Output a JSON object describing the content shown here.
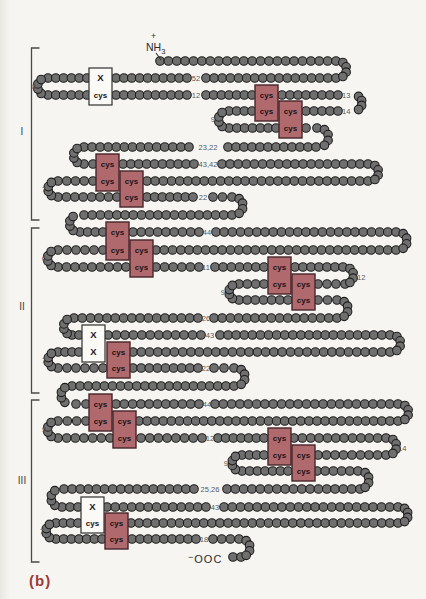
{
  "figure": {
    "panel_label": "(b)",
    "description_type": "protein-chain-loop-diagram",
    "amino_terminus": {
      "charge": "+",
      "text": "NH",
      "subscript": "3"
    },
    "carboxy_terminus": {
      "charge": "−",
      "text": "OOC"
    },
    "domains": [
      {
        "numeral": "I",
        "label_x": 22,
        "label_y": 135,
        "bracket": {
          "x": 31.5,
          "y1": 48,
          "y2": 220,
          "tick": 8
        }
      },
      {
        "numeral": "II",
        "label_x": 22,
        "label_y": 310,
        "bracket": {
          "x": 31.5,
          "y1": 228,
          "y2": 393,
          "tick": 8
        }
      },
      {
        "numeral": "III",
        "label_x": 22,
        "label_y": 484,
        "bracket": {
          "x": 31.5,
          "y1": 400,
          "y2": 562,
          "tick": 8
        }
      }
    ],
    "colors": {
      "background": "#f6f5f1",
      "bead_fill": "#6f6f6f",
      "bead_stroke": "#1f1f1f",
      "cys_box_fill": "#b06a6d",
      "cys_box_stroke": "#46262a",
      "x_box_fill": "#fbfaf7",
      "x_box_stroke": "#2f2f2f",
      "box_text": "#211317",
      "number_text": "#575757",
      "terminus_text": "#2b2b2b",
      "bracket": "#4a4a4a",
      "panel_red": "#9e3a36"
    },
    "geometry": {
      "bead_r": 4.3,
      "bead_spacing": 8.2,
      "box_w": 23,
      "runs": [
        [
          61,
          160,
          336
        ],
        [
          78,
          48,
          87
        ],
        [
          78,
          116,
          187
        ],
        [
          78,
          206,
          336
        ],
        [
          95,
          48,
          87
        ],
        [
          95,
          116,
          187
        ],
        [
          95,
          206,
          252
        ],
        [
          95,
          282,
          338
        ],
        [
          111,
          229,
          252
        ],
        [
          111,
          306,
          338
        ],
        [
          128,
          229,
          276
        ],
        [
          128,
          306,
          317
        ],
        [
          147,
          84,
          189
        ],
        [
          147,
          228,
          316
        ],
        [
          164,
          84,
          93
        ],
        [
          164,
          123,
          194
        ],
        [
          164,
          222,
          368
        ],
        [
          181,
          58,
          93
        ],
        [
          181,
          147,
          368
        ],
        [
          197,
          58,
          117
        ],
        [
          197,
          147,
          193
        ],
        [
          197,
          213,
          232
        ],
        [
          215,
          84,
          232
        ],
        [
          232,
          80,
          103
        ],
        [
          232,
          133,
          199
        ],
        [
          232,
          216,
          396
        ],
        [
          250,
          58,
          103
        ],
        [
          250,
          156,
          396
        ],
        [
          267,
          58,
          126
        ],
        [
          267,
          156,
          199
        ],
        [
          267,
          215,
          264
        ],
        [
          267,
          295,
          343
        ],
        [
          284,
          239,
          264
        ],
        [
          284,
          318,
          345
        ],
        [
          300,
          239,
          288
        ],
        [
          300,
          318,
          337
        ],
        [
          318,
          74,
          198
        ],
        [
          318,
          214,
          337
        ],
        [
          335,
          72,
          79
        ],
        [
          335,
          108,
          201
        ],
        [
          335,
          220,
          390
        ],
        [
          352,
          58,
          79
        ],
        [
          352,
          133,
          390
        ],
        [
          368,
          58,
          103
        ],
        [
          368,
          133,
          198
        ],
        [
          368,
          214,
          234
        ],
        [
          386,
          72,
          234
        ],
        [
          404,
          76,
          86
        ],
        [
          404,
          116,
          199
        ],
        [
          404,
          215,
          398
        ],
        [
          421,
          58,
          86
        ],
        [
          421,
          139,
          398
        ],
        [
          438,
          58,
          110
        ],
        [
          438,
          141,
          202
        ],
        [
          438,
          218,
          264
        ],
        [
          438,
          294,
          386
        ],
        [
          455,
          242,
          264
        ],
        [
          455,
          318,
          386
        ],
        [
          471,
          242,
          288
        ],
        [
          471,
          317,
          358
        ],
        [
          489,
          64,
          194
        ],
        [
          489,
          227,
          360
        ],
        [
          507,
          62,
          78
        ],
        [
          507,
          107,
          206
        ],
        [
          507,
          224,
          398
        ],
        [
          523,
          56,
          78
        ],
        [
          523,
          131,
          398
        ],
        [
          539,
          56,
          102
        ],
        [
          539,
          132,
          196
        ],
        [
          539,
          213,
          239
        ],
        [
          557,
          233,
          241
        ]
      ],
      "turns": [
        [
          46,
          86.5,
          "L",
          8.5
        ],
        [
          338,
          69.5,
          "R",
          8.5
        ],
        [
          354,
          103,
          "R",
          8
        ],
        [
          227,
          119.5,
          "L",
          8.5
        ],
        [
          319,
          137.5,
          "R",
          9.5
        ],
        [
          82,
          155.5,
          "L",
          8.5
        ],
        [
          370,
          172.5,
          "R",
          8.5
        ],
        [
          56,
          189,
          "L",
          8
        ],
        [
          234,
          206,
          "R",
          9
        ],
        [
          78,
          223.5,
          "L",
          8.5
        ],
        [
          398,
          241,
          "R",
          9
        ],
        [
          56,
          258.5,
          "L",
          8.5
        ],
        [
          345,
          275.5,
          "R",
          8.5
        ],
        [
          237,
          292,
          "L",
          8
        ],
        [
          339,
          309,
          "R",
          9
        ],
        [
          72,
          326.5,
          "L",
          8.5
        ],
        [
          392,
          343.5,
          "R",
          8.5
        ],
        [
          56,
          360,
          "L",
          8
        ],
        [
          236,
          377,
          "R",
          9
        ],
        [
          70,
          395,
          "L",
          9
        ],
        [
          400,
          412.5,
          "R",
          8.5
        ],
        [
          56,
          429.5,
          "L",
          8.5
        ],
        [
          388,
          446.5,
          "R",
          8.5
        ],
        [
          240,
          463,
          "L",
          8
        ],
        [
          360,
          480,
          "R",
          9
        ],
        [
          60,
          498,
          "L",
          9
        ],
        [
          400,
          515,
          "R",
          8
        ],
        [
          54,
          531,
          "L",
          8
        ],
        [
          241,
          548,
          "R",
          9
        ]
      ],
      "boxes": [
        [
          89,
          78,
          95,
          "w",
          "X",
          "cys"
        ],
        [
          255,
          95,
          111,
          "r",
          "cys",
          "cys"
        ],
        [
          279,
          111,
          128,
          "r",
          "cys",
          "cys"
        ],
        [
          96,
          164,
          181,
          "r",
          "cys",
          "cys"
        ],
        [
          120,
          181,
          197,
          "r",
          "cys",
          "cys"
        ],
        [
          106,
          232,
          250,
          "r",
          "cys",
          "cys"
        ],
        [
          130,
          250,
          267,
          "r",
          "cys",
          "cys"
        ],
        [
          268,
          267,
          284,
          "r",
          "cys",
          "cys"
        ],
        [
          292,
          284,
          300,
          "r",
          "cys",
          "cys"
        ],
        [
          82,
          335,
          352,
          "w",
          "X",
          "X"
        ],
        [
          107,
          352,
          368,
          "r",
          "cys",
          "cys"
        ],
        [
          89,
          404,
          421,
          "r",
          "cys",
          "cys"
        ],
        [
          113,
          421,
          438,
          "r",
          "cys",
          "cys"
        ],
        [
          268,
          438,
          455,
          "r",
          "cys",
          "cys"
        ],
        [
          292,
          455,
          471,
          "r",
          "cys",
          "cys"
        ],
        [
          81,
          507,
          523,
          "w",
          "X",
          "cys"
        ],
        [
          105,
          523,
          539,
          "r",
          "cys",
          "cys"
        ]
      ],
      "residue_labels": [
        [
          "8",
          36,
          89,
          "e"
        ],
        [
          "52",
          196,
          80.5,
          "m"
        ],
        [
          "12",
          196,
          97.5,
          "m"
        ],
        [
          "13",
          342,
          97.5,
          "s"
        ],
        [
          "14",
          342,
          113.5,
          "s"
        ],
        [
          "9",
          215,
          122,
          "e"
        ],
        [
          "23,22",
          208,
          149.5,
          "m"
        ],
        [
          "43,42",
          208,
          166.5,
          "m"
        ],
        [
          "7",
          46,
          191.5,
          "e"
        ],
        [
          "22",
          203,
          199.5,
          "m"
        ],
        [
          "44",
          207,
          234.5,
          "m"
        ],
        [
          "6",
          46,
          261,
          "e"
        ],
        [
          "11",
          206,
          269.5,
          "m"
        ],
        [
          "12",
          357,
          279.5,
          "s"
        ],
        [
          "9",
          225,
          294.5,
          "e"
        ],
        [
          "26",
          206,
          320.5,
          "m"
        ],
        [
          "43",
          210,
          337.5,
          "m"
        ],
        [
          "7",
          46,
          362.5,
          "e"
        ],
        [
          "22",
          206,
          370.5,
          "m"
        ],
        [
          "44",
          207,
          406.5,
          "m"
        ],
        [
          "9",
          46,
          432,
          "e"
        ],
        [
          "12",
          210,
          440.5,
          "m"
        ],
        [
          "14",
          398,
          451,
          "s"
        ],
        [
          "9",
          228,
          465.5,
          "e"
        ],
        [
          "25,26",
          210,
          491.5,
          "m"
        ],
        [
          "43",
          215,
          509.5,
          "m"
        ],
        [
          "7",
          44,
          533.5,
          "e"
        ],
        [
          "18",
          204,
          541.5,
          "m"
        ]
      ],
      "amino_pos": {
        "plus_x": 151,
        "plus_y": 39,
        "text_x": 146,
        "text_y": 51,
        "bond": [
          156,
          53,
          161,
          60
        ]
      },
      "carboxy_pos": {
        "x": 188,
        "y": 563
      }
    }
  }
}
